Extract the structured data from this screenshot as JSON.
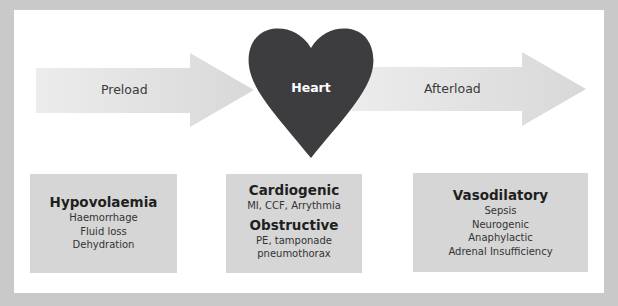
{
  "diagram": {
    "colors": {
      "background": "#c9c9c9",
      "panel": "#ffffff",
      "arrow": "#dcdcdc",
      "heart": "#3d3c3e",
      "box": "#d6d6d6"
    },
    "arrows": {
      "preload": {
        "label": "Preload"
      },
      "afterload": {
        "label": "Afterload"
      }
    },
    "heart": {
      "label": "Heart"
    },
    "boxes": [
      {
        "groups": [
          {
            "title": "Hypovolaemia",
            "items": [
              "Haemorrhage",
              "Fluid loss",
              "Dehydration"
            ]
          }
        ]
      },
      {
        "groups": [
          {
            "title": "Cardiogenic",
            "items": [
              "MI, CCF, Arrythmia"
            ]
          },
          {
            "title": "Obstructive",
            "items": [
              "PE, tamponade",
              "pneumothorax"
            ]
          }
        ]
      },
      {
        "groups": [
          {
            "title": "Vasodilatory",
            "items": [
              "Sepsis",
              "Neurogenic",
              "Anaphylactic",
              "Adrenal Insufficiency"
            ]
          }
        ]
      }
    ]
  }
}
